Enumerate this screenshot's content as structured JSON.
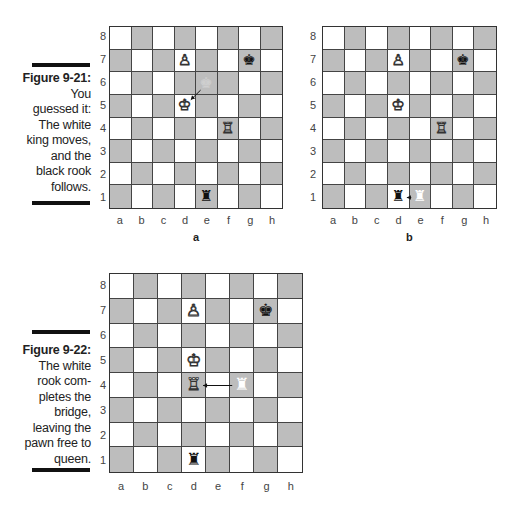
{
  "figures": [
    {
      "id": "9-21",
      "label": "Figure 9-21:",
      "caption_lines": [
        "You",
        "guessed it:",
        "The white",
        "king moves,",
        "and the",
        "black rook",
        "follows."
      ]
    },
    {
      "id": "9-22",
      "label": "Figure 9-22:",
      "caption_lines": [
        "The white",
        "rook com-",
        "pletes the",
        "bridge,",
        "leaving the",
        "pawn free to",
        "queen."
      ]
    }
  ],
  "files": [
    "a",
    "b",
    "c",
    "d",
    "e",
    "f",
    "g",
    "h"
  ],
  "ranks": [
    "8",
    "7",
    "6",
    "5",
    "4",
    "3",
    "2",
    "1"
  ],
  "boards": [
    {
      "name": "board-a",
      "sublabel": "a",
      "pieces": [
        {
          "square": "d7",
          "glyph": "♙",
          "kind": "white-pawn"
        },
        {
          "square": "g7",
          "glyph": "♚",
          "kind": "black-king"
        },
        {
          "square": "e6",
          "glyph": "♚",
          "kind": "ghost-king"
        },
        {
          "square": "d5",
          "glyph": "♔",
          "kind": "white-king"
        },
        {
          "square": "f4",
          "glyph": "♖",
          "kind": "white-rook"
        },
        {
          "square": "e1",
          "glyph": "♜",
          "kind": "black-rook"
        }
      ],
      "highlight": [
        "e6"
      ],
      "arrow": {
        "from": "e6",
        "to": "d5"
      }
    },
    {
      "name": "board-b",
      "sublabel": "b",
      "pieces": [
        {
          "square": "d7",
          "glyph": "♙",
          "kind": "white-pawn"
        },
        {
          "square": "g7",
          "glyph": "♚",
          "kind": "black-king"
        },
        {
          "square": "d5",
          "glyph": "♔",
          "kind": "white-king"
        },
        {
          "square": "f4",
          "glyph": "♖",
          "kind": "white-rook"
        },
        {
          "square": "d1",
          "glyph": "♜",
          "kind": "black-rook"
        },
        {
          "square": "e1",
          "glyph": "♜",
          "kind": "ghost-rook"
        }
      ],
      "highlight": [],
      "arrow": {
        "from": "e1",
        "to": "d1"
      }
    },
    {
      "name": "board-c",
      "sublabel": "",
      "pieces": [
        {
          "square": "d7",
          "glyph": "♙",
          "kind": "white-pawn"
        },
        {
          "square": "g7",
          "glyph": "♚",
          "kind": "black-king"
        },
        {
          "square": "d5",
          "glyph": "♔",
          "kind": "white-king"
        },
        {
          "square": "d4",
          "glyph": "♖",
          "kind": "white-rook"
        },
        {
          "square": "f4",
          "glyph": "♜",
          "kind": "ghost-rook"
        },
        {
          "square": "d1",
          "glyph": "♜",
          "kind": "black-rook"
        }
      ],
      "highlight": [],
      "arrow": {
        "from": "f4",
        "to": "d4"
      }
    }
  ],
  "colors": {
    "light": "#ffffff",
    "dark": "#bdbdbd",
    "grid": "#444444",
    "ghost": "#cfcfcf"
  }
}
